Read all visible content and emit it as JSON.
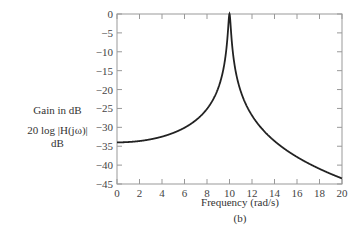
{
  "chart_data": {
    "type": "line",
    "title": "",
    "subtitle": "(b)",
    "xlabel": "Frequency (rad/s)",
    "ylabel_lines": [
      "Gain in dB",
      "20 log |H(jω)|",
      "dB"
    ],
    "xlim": [
      0,
      20
    ],
    "ylim": [
      -45,
      0
    ],
    "x_ticks": [
      0,
      2,
      4,
      6,
      8,
      10,
      12,
      14,
      16,
      18,
      20
    ],
    "y_ticks": [
      0,
      -5,
      -10,
      -15,
      -20,
      -25,
      -30,
      -35,
      -40,
      -45
    ],
    "y_tick_labels": [
      "0",
      "−5",
      "−10",
      "−15",
      "−20",
      "−25",
      "−30",
      "−35",
      "−40",
      "−45"
    ],
    "grid": false,
    "legend": null,
    "series": [
      {
        "name": "Gain",
        "color": "#222222",
        "x": [
          0,
          1,
          2,
          3,
          4,
          5,
          6,
          7,
          8,
          9,
          9.5,
          9.8,
          10,
          10.2,
          10.5,
          11,
          12,
          13,
          14,
          15,
          16,
          17,
          18,
          19,
          20
        ],
        "y": [
          -34.0,
          -33.9,
          -33.6,
          -33.2,
          -32.5,
          -31.5,
          -30.1,
          -28.1,
          -25.1,
          -19.6,
          -13.9,
          -6.5,
          0,
          -6.9,
          -14.3,
          -20.4,
          -26.8,
          -30.5,
          -33.2,
          -35.1,
          -36.8,
          -38.2,
          -39.5,
          -40.7,
          -41.6
        ]
      }
    ]
  },
  "labels": {
    "ylabel_1": "Gain in dB",
    "ylabel_2": "20 log |H(jω)|",
    "ylabel_3": "dB",
    "xlabel": "Frequency (rad/s)",
    "caption": "(b)"
  }
}
